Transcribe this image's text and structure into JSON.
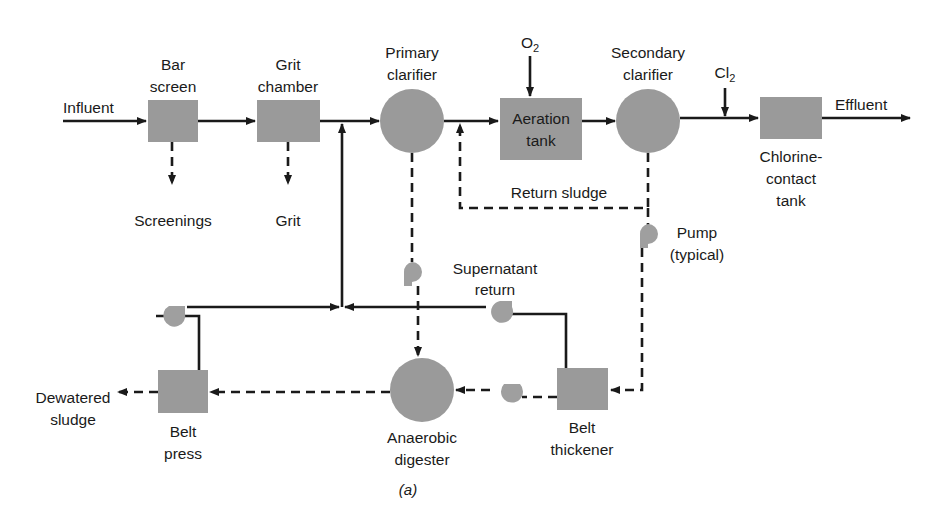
{
  "diagram": {
    "caption": "(a)",
    "colors": {
      "unit_fill": "#9a9a9a",
      "line": "#1a1a1a",
      "background": "#ffffff"
    },
    "units": {
      "bar_screen": {
        "line1": "Bar",
        "line2": "screen",
        "shape": "square"
      },
      "grit_chamber": {
        "line1": "Grit",
        "line2": "chamber",
        "shape": "square"
      },
      "primary_clarifier": {
        "line1": "Primary",
        "line2": "clarifier",
        "shape": "circle"
      },
      "aeration_tank": {
        "line1": "Aeration",
        "line2": "tank",
        "shape": "rectangle"
      },
      "secondary_clarifier": {
        "line1": "Secondary",
        "line2": "clarifier",
        "shape": "circle"
      },
      "chlorine_contact_tank": {
        "line1": "Chlorine-",
        "line2": "contact",
        "line3": "tank",
        "shape": "rectangle"
      },
      "anaerobic_digester": {
        "line1": "Anaerobic",
        "line2": "digester",
        "shape": "circle"
      },
      "belt_thickener": {
        "line1": "Belt",
        "line2": "thickener",
        "shape": "square"
      },
      "belt_press": {
        "line1": "Belt",
        "line2": "press",
        "shape": "square"
      }
    },
    "streams": {
      "influent": "Influent",
      "effluent": "Effluent",
      "screenings": "Screenings",
      "grit": "Grit",
      "oxygen": {
        "base": "O",
        "sub": "2"
      },
      "chlorine": {
        "base": "Cl",
        "sub": "2"
      },
      "return_sludge": "Return sludge",
      "supernatant_line1": "Supernatant",
      "supernatant_line2": "return",
      "dewatered_line1": "Dewatered",
      "dewatered_line2": "sludge"
    },
    "legend": {
      "pump_line1": "Pump",
      "pump_line2": "(typical)"
    }
  }
}
